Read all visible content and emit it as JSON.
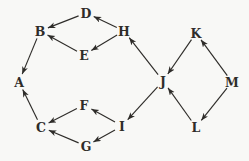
{
  "diagram": {
    "type": "directed-graph",
    "background": "#f8f8f6",
    "ink": "#2e2c29",
    "nodes": [
      {
        "id": "A",
        "label": "A",
        "x": 19,
        "y": 82
      },
      {
        "id": "B",
        "label": "B",
        "x": 40,
        "y": 31
      },
      {
        "id": "C",
        "label": "C",
        "x": 41,
        "y": 127
      },
      {
        "id": "D",
        "label": "D",
        "x": 86,
        "y": 13
      },
      {
        "id": "E",
        "label": "E",
        "x": 84,
        "y": 55
      },
      {
        "id": "F",
        "label": "F",
        "x": 84,
        "y": 105
      },
      {
        "id": "G",
        "label": "G",
        "x": 86,
        "y": 146
      },
      {
        "id": "H",
        "label": "H",
        "x": 124,
        "y": 31
      },
      {
        "id": "I",
        "label": "I",
        "x": 122,
        "y": 126
      },
      {
        "id": "J",
        "label": "J",
        "x": 163,
        "y": 81
      },
      {
        "id": "K",
        "label": "K",
        "x": 196,
        "y": 33
      },
      {
        "id": "L",
        "label": "L",
        "x": 196,
        "y": 127
      },
      {
        "id": "M",
        "label": "M",
        "x": 232,
        "y": 82
      }
    ],
    "edges": [
      {
        "from": "D",
        "to": "B"
      },
      {
        "from": "E",
        "to": "B"
      },
      {
        "from": "H",
        "to": "D"
      },
      {
        "from": "H",
        "to": "E"
      },
      {
        "from": "B",
        "to": "A"
      },
      {
        "from": "C",
        "to": "A"
      },
      {
        "from": "F",
        "to": "C"
      },
      {
        "from": "G",
        "to": "C"
      },
      {
        "from": "I",
        "to": "F"
      },
      {
        "from": "I",
        "to": "G"
      },
      {
        "from": "J",
        "to": "I"
      },
      {
        "from": "J",
        "to": "H"
      },
      {
        "from": "K",
        "to": "J"
      },
      {
        "from": "L",
        "to": "J"
      },
      {
        "from": "M",
        "to": "K"
      },
      {
        "from": "M",
        "to": "L"
      }
    ]
  }
}
